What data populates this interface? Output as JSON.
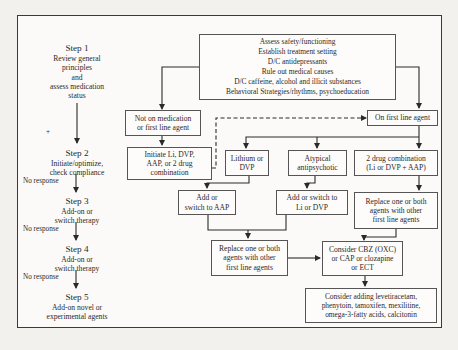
{
  "steps": [
    {
      "title": "Step 1",
      "lines": [
        "Review general",
        "principles",
        "and",
        "assess medication",
        "status"
      ]
    },
    {
      "title": "Step 2",
      "lines": [
        "Initiate/optimize,",
        "check compliance"
      ]
    },
    {
      "title": "Step 3",
      "lines": [
        "Add-on or",
        "switch therapy"
      ]
    },
    {
      "title": "Step 4",
      "lines": [
        "Add-on or",
        "switch therapy"
      ]
    },
    {
      "title": "Step 5",
      "lines": [
        "Add-on novel or",
        "experimental agents"
      ]
    }
  ],
  "plus_mark": "+",
  "no_response_label": "No response",
  "nodes": {
    "assess": [
      "Assess safety/functioning",
      "Establish treatment setting",
      "D/C antidepressants",
      "Rule out medical causes",
      "D/C caffeine, alcohol and illicit substances",
      "Behavioral Strategies/rhythms, psychoeducation"
    ],
    "not_on_med": [
      "Not on medication",
      "or first line agent"
    ],
    "on_first_line": [
      "On first line agent"
    ],
    "initiate": [
      "Initiate Li, DVP,",
      "AAP, or 2 drug",
      "combination"
    ],
    "lithium_dvp": [
      "Lithium or",
      "DVP"
    ],
    "atypical": [
      "Atypical",
      "antipsychotic"
    ],
    "two_drug": [
      "2 drug combination",
      "(Li or DVP + AAP)"
    ],
    "add_aap": [
      "Add or",
      "switch to AAP"
    ],
    "add_li_dvp": [
      "Add or switch to",
      "Li or DVP"
    ],
    "replace_right": [
      "Replace one or both",
      "agents with other",
      "first line agents"
    ],
    "replace_mid": [
      "Replace one or both",
      "agents with other",
      "first line agents"
    ],
    "consider_cbz": [
      "Consider CBZ (OXC)",
      "or CAP or clozapine",
      "or ECT"
    ],
    "consider_adding": [
      "Consider adding levetiracetam,",
      "phenytoin, tamoxifen, mexilitine,",
      "omega-3-fatty acids, calcitonin"
    ]
  }
}
